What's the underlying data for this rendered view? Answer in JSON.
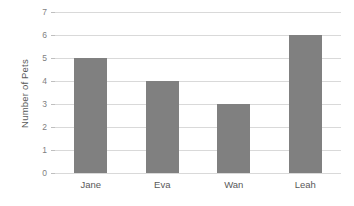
{
  "chart_data": {
    "type": "bar",
    "title": "",
    "subtitle": "",
    "xlabel": "",
    "ylabel": "Number of Pets",
    "categories": [
      "Jane",
      "Eva",
      "Wan",
      "Leah"
    ],
    "values": [
      5,
      4,
      3,
      6
    ],
    "series": [
      {
        "name": "Number of Pets",
        "values": [
          5,
          4,
          3,
          6
        ]
      }
    ],
    "ylim": [
      0,
      7
    ],
    "yticks": [
      0,
      1,
      2,
      3,
      4,
      5,
      6,
      7
    ],
    "ytick_labels": [
      "0",
      "1",
      "2",
      "3",
      "4",
      "5",
      "6",
      "7"
    ],
    "grid": "horizontal",
    "legend": "none",
    "annotations": [],
    "colors": {
      "bar": "#808080",
      "gridline": "#d9d9d9",
      "axis_line": "#bfbfbf",
      "tick_label": "#7f7f7f",
      "axis_title": "#595959",
      "background": "#ffffff"
    }
  }
}
